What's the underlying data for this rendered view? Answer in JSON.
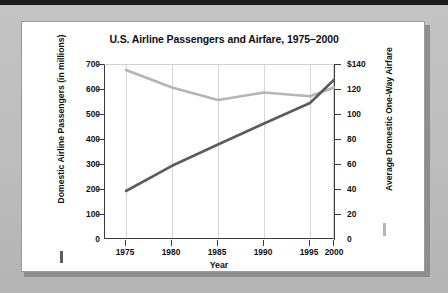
{
  "chart_data": {
    "type": "line",
    "title": "U.S. Airline Passengers and Airfare, 1975–2000",
    "xlabel": "Year",
    "x": [
      1975,
      1980,
      1985,
      1990,
      1995,
      2000
    ],
    "xticklabels": [
      "1975",
      "1980",
      "1985",
      "1990",
      "1995",
      "2000"
    ],
    "xlim": [
      1973,
      2002
    ],
    "grid": "vertical",
    "legend_position": "axis-titles",
    "axes": [
      {
        "id": "left",
        "ylabel": "Domestic Airline Passengers (in millions)",
        "ylim": [
          0,
          700
        ],
        "yticks": [
          0,
          100,
          200,
          300,
          400,
          500,
          600,
          700
        ],
        "yticklabels": [
          "0",
          "100",
          "200",
          "300",
          "400",
          "500",
          "600",
          "700"
        ],
        "color": "#5c5c5c"
      },
      {
        "id": "right",
        "ylabel": "Average Domestic One-Way Airfare",
        "ylim": [
          0,
          140
        ],
        "yticks": [
          0,
          20,
          40,
          60,
          80,
          100,
          120,
          140
        ],
        "yticklabels": [
          "0",
          "20",
          "40",
          "60",
          "80",
          "100",
          "120",
          "$140"
        ],
        "color": "#b5b5b5"
      }
    ],
    "series": [
      {
        "name": "Domestic Airline Passengers (in millions)",
        "axis": "left",
        "color": "#5c5c5c",
        "values": [
          196,
          297,
          382,
          466,
          548,
          641
        ]
      },
      {
        "name": "Average Domestic One-Way Airfare",
        "axis": "right",
        "color": "#b5b5b5",
        "values": [
          136,
          122,
          112,
          118,
          115,
          122
        ]
      }
    ]
  }
}
